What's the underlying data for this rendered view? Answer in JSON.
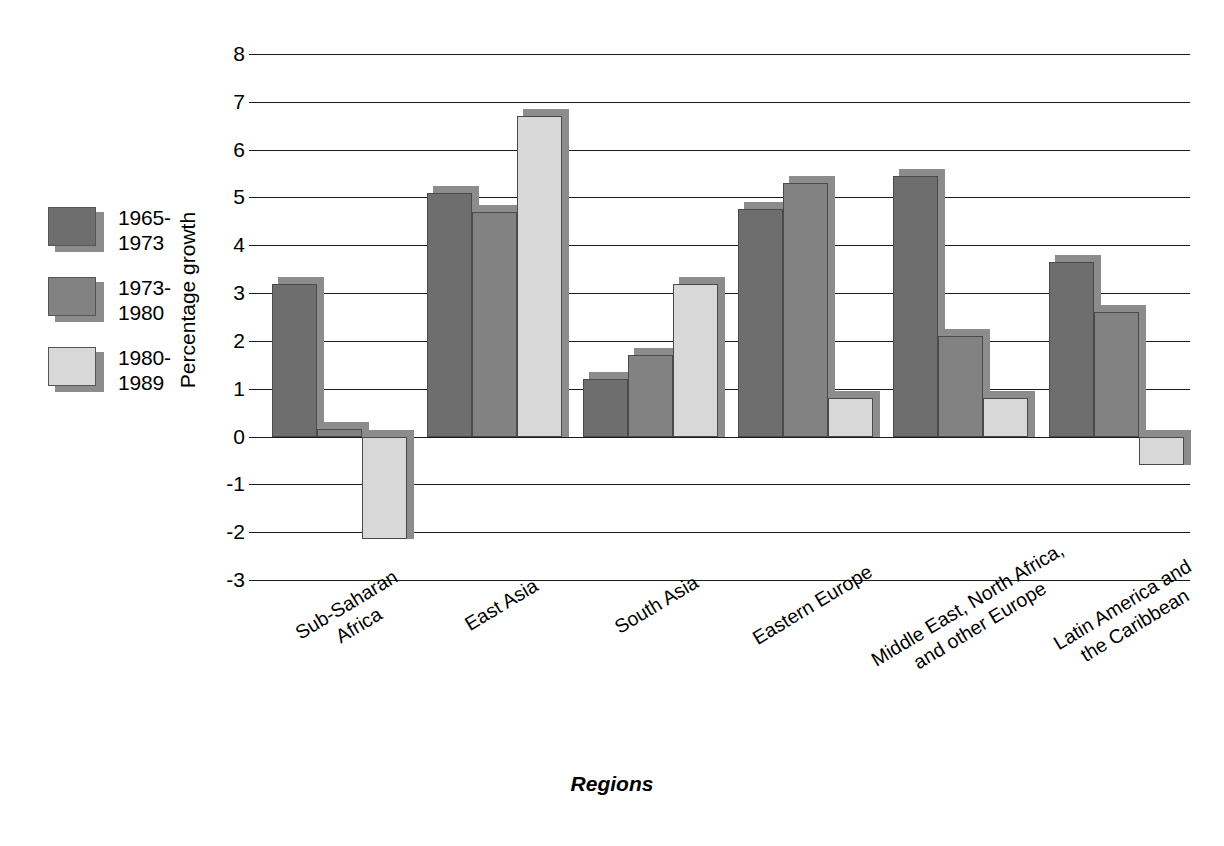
{
  "chart_data": {
    "type": "bar",
    "title": "",
    "xlabel": "Regions",
    "ylabel": "Percentage growth",
    "ylim": [
      -3,
      8
    ],
    "ytick_step": 1,
    "grid": true,
    "legend_position": "left",
    "categories": [
      "Sub-Saharan\nAfrica",
      "East Asia",
      "South Asia",
      "Eastern Europe",
      "Middle East, North Africa,\nand other Europe",
      "Latin America and\nthe Caribbean"
    ],
    "yticks": [
      "8",
      "7",
      "6",
      "5",
      "4",
      "3",
      "2",
      "1",
      "0",
      "-1",
      "-2",
      "-3"
    ],
    "series": [
      {
        "name": "1965-\n1973",
        "color": "#6e6e6e",
        "values": [
          3.2,
          5.1,
          1.2,
          4.75,
          5.45,
          3.65
        ]
      },
      {
        "name": "1973-\n1980",
        "color": "#828282",
        "values": [
          0.15,
          4.7,
          1.7,
          5.3,
          2.1,
          2.6
        ]
      },
      {
        "name": "1980-\n1989",
        "color": "#d8d8d8",
        "values": [
          -2.15,
          6.7,
          3.2,
          0.8,
          0.8,
          -0.6
        ]
      }
    ]
  },
  "legend": {
    "items": [
      {
        "label": "1965-\n1973",
        "color": "#6e6e6e"
      },
      {
        "label": "1973-\n1980",
        "color": "#828282"
      },
      {
        "label": "1980-\n1989",
        "color": "#d8d8d8"
      }
    ]
  },
  "axes": {
    "x_title": "Regions",
    "y_title": "Percentage growth"
  },
  "colors": {
    "series1": "#6e6e6e",
    "series2": "#828282",
    "series3": "#d8d8d8",
    "axis": "#1a1a1a",
    "background": "#ffffff",
    "shadow": "#8c8c8c"
  }
}
